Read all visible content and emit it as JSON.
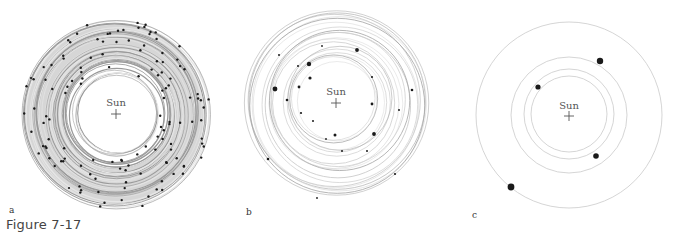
{
  "figure": {
    "caption": "Figure 7-17",
    "sun_label": "Sun",
    "panels": [
      {
        "label": "a",
        "stage": "many planetesimals",
        "orbit_count": "dense",
        "body_count": 130,
        "body_size": "small",
        "orbit_band": "gray shaded ring"
      },
      {
        "label": "b",
        "stage": "fewer, larger protoplanets",
        "body_count": 23,
        "body_size": "small to medium"
      },
      {
        "label": "c",
        "stage": "few planets",
        "orbit_count": 4,
        "body_count": 4,
        "body_size": "large"
      }
    ]
  },
  "colors": {
    "orbit_light": "#d0d0d0",
    "orbit_dark": "#9a9a9a",
    "band": "#b5b5b5",
    "body": "#1a1a1a",
    "text": "#555555"
  }
}
